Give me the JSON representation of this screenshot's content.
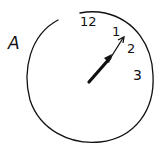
{
  "diagram": {
    "type": "hand-drawn clock face",
    "label": "A",
    "numbers": [
      {
        "value": "12",
        "position": "top"
      },
      {
        "value": "1",
        "position": "upper-right"
      },
      {
        "value": "2",
        "position": "right-upper"
      },
      {
        "value": "3",
        "position": "right"
      }
    ],
    "hands": [
      {
        "name": "hour-hand",
        "points_toward": "1",
        "style": "thick"
      },
      {
        "name": "minute-hand",
        "points_toward": "1",
        "style": "thin"
      }
    ],
    "colors": {
      "stroke": "#111111",
      "background": "#ffffff"
    }
  }
}
